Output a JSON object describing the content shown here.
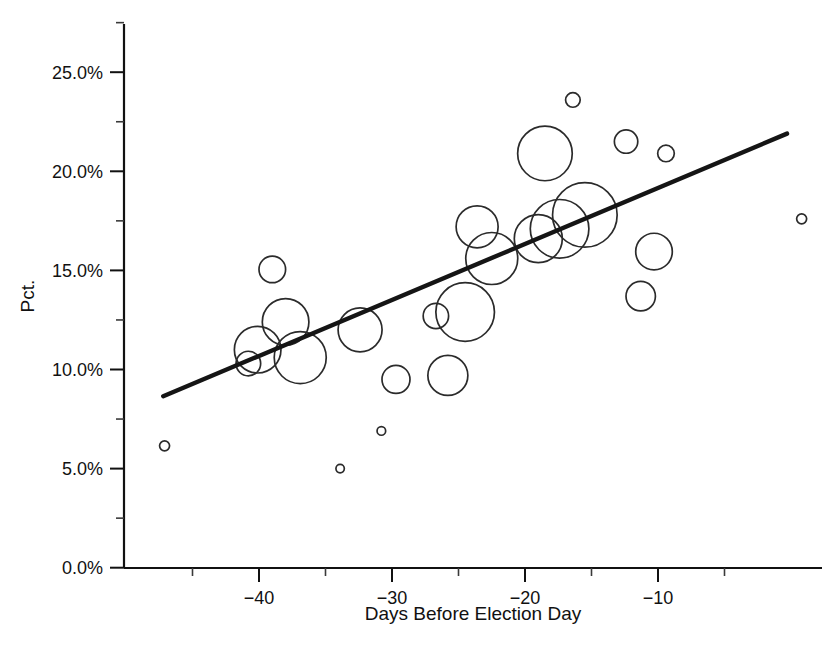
{
  "chart_data": {
    "type": "scatter",
    "title": "",
    "subtitle": "",
    "xlabel": "Days Before Election Day",
    "ylabel": "Pct.",
    "xlim": [
      -48.5,
      2.5
    ],
    "ylim": [
      0.0,
      27.5
    ],
    "grid": false,
    "legend": "none",
    "x_ticks_major": [
      -40,
      -30,
      -20,
      -10
    ],
    "x_tick_labels": [
      "−40",
      "−30",
      "−20",
      "−10"
    ],
    "x_ticks_minor": [
      -45,
      -35,
      -25,
      -15,
      -5
    ],
    "y_ticks_major": [
      0.0,
      5.0,
      10.0,
      15.0,
      20.0,
      25.0
    ],
    "y_tick_labels": [
      "0.0%",
      "5.0%",
      "10.0%",
      "15.0%",
      "20.0%",
      "25.0%"
    ],
    "y_ticks_minor": [
      2.5,
      7.5,
      12.5,
      17.5,
      22.5,
      27.5
    ],
    "marker_style": "open-circle",
    "size_encoding": "bubble area proportional to weight",
    "series": [
      {
        "name": "Poll observations",
        "points": [
          {
            "x": -47.1,
            "y": 6.15,
            "size": 5.0
          },
          {
            "x": -40.8,
            "y": 10.3,
            "size": 12.3
          },
          {
            "x": -40.1,
            "y": 11.0,
            "size": 23.3
          },
          {
            "x": -39.0,
            "y": 15.05,
            "size": 13.3
          },
          {
            "x": -38.0,
            "y": 12.4,
            "size": 23.3
          },
          {
            "x": -36.9,
            "y": 10.6,
            "size": 26.0
          },
          {
            "x": -33.9,
            "y": 5.0,
            "size": 4.2
          },
          {
            "x": -32.4,
            "y": 12.0,
            "size": 22.0
          },
          {
            "x": -30.8,
            "y": 6.9,
            "size": 4.3
          },
          {
            "x": -29.7,
            "y": 9.5,
            "size": 14.0
          },
          {
            "x": -26.7,
            "y": 12.7,
            "size": 12.7
          },
          {
            "x": -25.8,
            "y": 9.7,
            "size": 20.0
          },
          {
            "x": -24.5,
            "y": 12.9,
            "size": 29.3
          },
          {
            "x": -23.6,
            "y": 17.2,
            "size": 21.0
          },
          {
            "x": -22.5,
            "y": 15.6,
            "size": 26.0
          },
          {
            "x": -19.0,
            "y": 16.6,
            "size": 24.0
          },
          {
            "x": -18.5,
            "y": 20.9,
            "size": 27.3
          },
          {
            "x": -17.4,
            "y": 17.1,
            "size": 29.3
          },
          {
            "x": -16.4,
            "y": 23.6,
            "size": 7.3
          },
          {
            "x": -15.5,
            "y": 17.8,
            "size": 32.3
          },
          {
            "x": -12.4,
            "y": 21.5,
            "size": 11.7
          },
          {
            "x": -11.3,
            "y": 13.7,
            "size": 14.7
          },
          {
            "x": -10.3,
            "y": 15.95,
            "size": 18.3
          },
          {
            "x": -9.4,
            "y": 20.9,
            "size": 8.3
          },
          {
            "x": 0.8,
            "y": 17.6,
            "size": 5.0
          }
        ]
      }
    ],
    "trend_line": {
      "name": "fitted regression line",
      "x_start": -47.2,
      "y_start": 8.65,
      "x_end": -0.3,
      "y_end": 21.9
    }
  }
}
